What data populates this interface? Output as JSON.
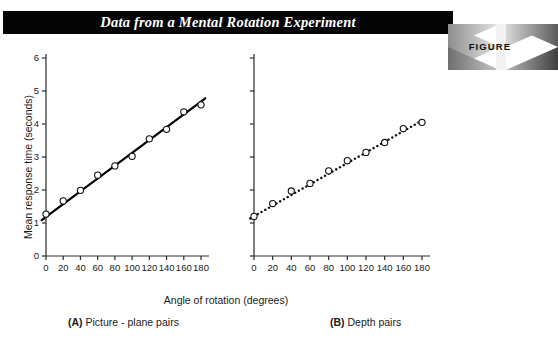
{
  "header": {
    "title": "Data from a Mental Rotation Experiment",
    "band_color": "#050505",
    "title_color": "#ffffff"
  },
  "figure_badge": {
    "word": "FIGURE",
    "number": "11.5",
    "word_color": "#111111",
    "number_color": "#ffffff"
  },
  "labels": {
    "ylabel": "Mean response time (seconds)",
    "xlabel": "Angle of rotation (degrees)",
    "caption_a_tag": "(A)",
    "caption_a_text": "Picture - plane pairs",
    "caption_b_tag": "(B)",
    "caption_b_text": "Depth pairs"
  },
  "chart_data": [
    {
      "type": "scatter",
      "panel": "A",
      "title": "(A) Picture - plane pairs",
      "xlabel": "Angle of rotation (degrees)",
      "ylabel": "Mean response time (seconds)",
      "xlim": [
        0,
        180
      ],
      "ylim": [
        0,
        6
      ],
      "xticks": [
        0,
        20,
        40,
        60,
        80,
        100,
        120,
        140,
        160,
        180
      ],
      "yticks": [
        0,
        1,
        2,
        3,
        4,
        5,
        6
      ],
      "xticklabels": [
        "0",
        "20",
        "40",
        "60",
        "80",
        "100",
        "120",
        "140",
        "160",
        "180"
      ],
      "yticklabels": [
        "0",
        "1",
        "2",
        "3",
        "4",
        "5",
        "6"
      ],
      "grid": false,
      "legend": null,
      "marker": "open-circle",
      "x": [
        0,
        20,
        40,
        60,
        80,
        100,
        120,
        140,
        160,
        180
      ],
      "y": [
        1.27,
        1.67,
        1.99,
        2.45,
        2.73,
        3.02,
        3.55,
        3.84,
        4.37,
        4.58
      ],
      "fit_line": {
        "style": "solid",
        "width_px": 2.2,
        "color": "#000000",
        "x": [
          -5,
          185
        ],
        "y": [
          1.09,
          4.78
        ]
      }
    },
    {
      "type": "scatter",
      "panel": "B",
      "title": "(B) Depth pairs",
      "xlabel": "Angle of rotation (degrees)",
      "ylabel": "",
      "xlim": [
        0,
        180
      ],
      "ylim": [
        0,
        6
      ],
      "xticks": [
        0,
        20,
        40,
        60,
        80,
        100,
        120,
        140,
        160,
        180
      ],
      "yticks": [
        0,
        1,
        2,
        3,
        4,
        5,
        6
      ],
      "xticklabels": [
        "0",
        "20",
        "40",
        "60",
        "80",
        "100",
        "120",
        "140",
        "160",
        "180"
      ],
      "yticklabels": [
        "",
        "",
        "",
        "",
        "",
        "",
        ""
      ],
      "grid": false,
      "legend": null,
      "marker": "open-circle",
      "x": [
        0,
        20,
        40,
        60,
        80,
        100,
        120,
        140,
        160,
        180
      ],
      "y": [
        1.2,
        1.59,
        1.97,
        2.2,
        2.58,
        2.89,
        3.14,
        3.44,
        3.86,
        4.05
      ],
      "fit_line": {
        "style": "dotted",
        "width_px": 2.2,
        "color": "#111111",
        "x": [
          -4,
          184
        ],
        "y": [
          1.14,
          4.17
        ]
      }
    }
  ]
}
